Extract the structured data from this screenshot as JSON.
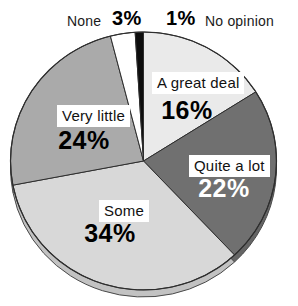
{
  "page": {
    "background": "#ffffff"
  },
  "chart_data": {
    "type": "pie",
    "title": "",
    "direction": "clockwise",
    "start_angle_deg": 0,
    "legend_position": "none",
    "outline_color": "#2e2e2e",
    "depth_rim": {
      "style": "3d-bottom-edge",
      "outline": "#4a4a4a"
    },
    "segments": [
      {
        "label": "A great deal",
        "value": 16,
        "display": "16%",
        "color": "#eaeaea",
        "label_placement": "inside"
      },
      {
        "label": "Quite a lot",
        "value": 22,
        "display": "22%",
        "color": "#707070",
        "label_placement": "inside"
      },
      {
        "label": "Some",
        "value": 34,
        "display": "34%",
        "color": "#d8d8d8",
        "label_placement": "inside"
      },
      {
        "label": "Very little",
        "value": 24,
        "display": "24%",
        "color": "#aaaaaa",
        "label_placement": "inside"
      },
      {
        "label": "None",
        "value": 3,
        "display": "3%",
        "color": "#ffffff",
        "label_placement": "outside-top"
      },
      {
        "label": "No opinion",
        "value": 1,
        "display": "1%",
        "color": "#0d0d0d",
        "label_placement": "outside-top"
      }
    ]
  }
}
